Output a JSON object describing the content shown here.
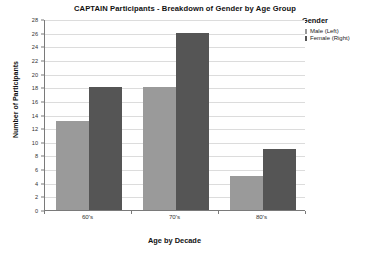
{
  "chart_data": {
    "type": "bar",
    "title": "CAPTAIN Participants - Breakdown of Gender by Age Group",
    "xlabel": "Age by Decade",
    "ylabel": "Number of Participants",
    "categories": [
      "60's",
      "70's",
      "80's"
    ],
    "series": [
      {
        "name": "Male (Left)",
        "color": "#9a9a9a",
        "values": [
          13,
          18,
          5
        ]
      },
      {
        "name": "Female (Right)",
        "color": "#555555",
        "values": [
          18,
          26,
          9
        ]
      }
    ],
    "ylim": [
      0,
      28
    ],
    "ytick_step": 2,
    "yticks": [
      0,
      2,
      4,
      6,
      8,
      10,
      12,
      14,
      16,
      18,
      20,
      22,
      24,
      26,
      28
    ],
    "grid": true,
    "grid_axis": "y",
    "legend": {
      "title": "Gender",
      "position": "top-right-outside",
      "entries": [
        "Male (Left)",
        "Female (Right)"
      ]
    }
  },
  "colors": {
    "male": "#9a9a9a",
    "female": "#555555",
    "gridline": "#dcdcdc",
    "axis": "#7a7a7a",
    "text": "#111111",
    "background": "#ffffff"
  }
}
